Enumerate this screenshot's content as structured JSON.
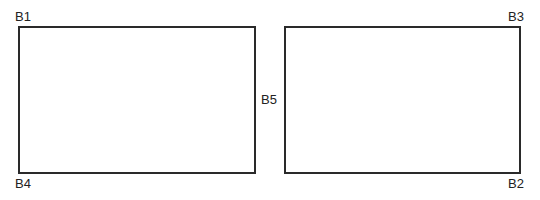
{
  "diagram": {
    "boxes": [
      {
        "id": "left-box"
      },
      {
        "id": "right-box"
      }
    ],
    "labels": {
      "b1": "B1",
      "b2": "B2",
      "b3": "B3",
      "b4": "B4",
      "b5": "B5"
    },
    "colors": {
      "line": "#2a2a2a",
      "text": "#222222",
      "background": "#ffffff"
    }
  }
}
